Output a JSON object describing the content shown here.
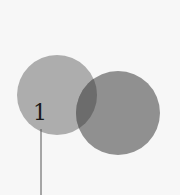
{
  "diagram": {
    "type": "overlapping-circles",
    "circles": [
      {
        "id": "left",
        "color": "#a9a9a9",
        "opacity": 0.95
      },
      {
        "id": "right",
        "color": "#7e7e7e",
        "opacity": 0.85
      }
    ],
    "overlap_color": "#6c6c6c",
    "callout": {
      "label": "1",
      "line_color": "#555555"
    },
    "background": "#f7f7f7"
  }
}
